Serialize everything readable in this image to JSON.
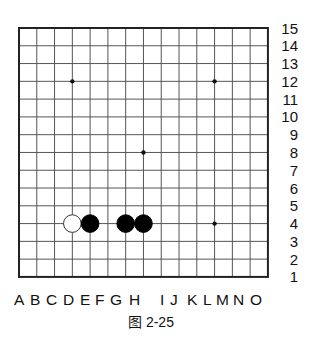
{
  "diagram": {
    "type": "go-board",
    "size": 15,
    "caption": "图 2-25",
    "columns": [
      "A",
      "B",
      "C",
      "D",
      "E",
      "F",
      "G",
      "H",
      "I",
      "J",
      "K",
      "L",
      "M",
      "N",
      "O"
    ],
    "rows": [
      "15",
      "14",
      "13",
      "12",
      "11",
      "10",
      "9",
      "8",
      "7",
      "6",
      "5",
      "4",
      "3",
      "2",
      "1"
    ],
    "star_points": [
      {
        "col": "D",
        "row": 12
      },
      {
        "col": "L",
        "row": 12
      },
      {
        "col": "H",
        "row": 8
      },
      {
        "col": "L",
        "row": 4
      }
    ],
    "stones": [
      {
        "color": "white",
        "col": "D",
        "row": 4
      },
      {
        "color": "black",
        "col": "E",
        "row": 4
      },
      {
        "color": "black",
        "col": "G",
        "row": 4
      },
      {
        "color": "black",
        "col": "H",
        "row": 4
      }
    ],
    "colors": {
      "background": "#ffffff",
      "border": "#222222",
      "grid": "#555555",
      "black_stone": "#000000",
      "white_stone_fill": "#ffffff",
      "white_stone_edge": "#333333"
    }
  }
}
